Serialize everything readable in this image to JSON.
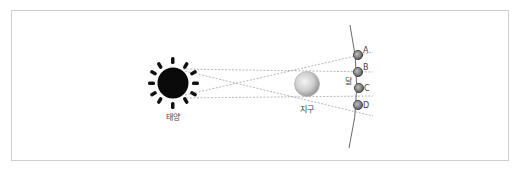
{
  "diagram": {
    "sun": {
      "label": "태양"
    },
    "earth": {
      "label": "지구"
    },
    "moon": {
      "label": "달"
    },
    "moon_positions": [
      {
        "label": "A"
      },
      {
        "label": "B"
      },
      {
        "label": "C"
      },
      {
        "label": "D"
      }
    ]
  }
}
